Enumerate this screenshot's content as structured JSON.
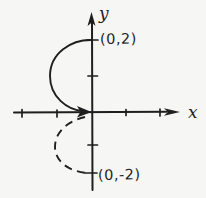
{
  "figure": {
    "paper_color": "#f6f6f4",
    "ink_color": "#1f1f1f",
    "axes": {
      "x_label": "x",
      "y_label": "y",
      "x_tick_values": [
        -2,
        -1,
        1,
        2
      ],
      "y_tick_values": [
        -2,
        -1,
        1,
        2
      ]
    },
    "points": {
      "top": {
        "label": "(0,2)",
        "coords": [
          0,
          2
        ]
      },
      "bottom": {
        "label": "(0,-2)",
        "coords": [
          0,
          -2
        ]
      }
    },
    "curves": [
      {
        "name": "upper-left-semicircle",
        "stroke_style": "solid",
        "start": [
          0,
          2
        ],
        "end": [
          0,
          0
        ],
        "center": [
          0,
          1
        ],
        "radius": 1,
        "quadrant": "II",
        "arrowhead_at_end": true
      },
      {
        "name": "lower-left-semicircle",
        "stroke_style": "dashed",
        "start": [
          0,
          0
        ],
        "end": [
          0,
          -2
        ],
        "center": [
          0,
          -1
        ],
        "radius": 1,
        "quadrant": "III",
        "arrowhead_at_end": false
      }
    ]
  }
}
